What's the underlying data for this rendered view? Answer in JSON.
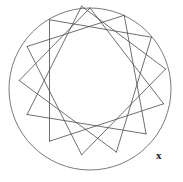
{
  "figure": {
    "name": "star-polygon-in-circle",
    "background_color": "#ffffff",
    "stroke_color": "#4a4a4a",
    "stroke_width": 0.8,
    "circle": {
      "cx": 90,
      "cy": 89,
      "r": 81,
      "stroke_color": "#6b6b6b",
      "stroke_width": 0.9,
      "fill": "none"
    },
    "vertex_count": 14,
    "star_step": 4,
    "start_angle_deg": -90,
    "vertices": [
      {
        "index": 0,
        "x": 90.0,
        "y": 8.0
      },
      {
        "index": 1,
        "x": 124.2,
        "y": 15.3
      },
      {
        "index": 2,
        "x": 151.4,
        "y": 37.2
      },
      {
        "index": 3,
        "x": 165.6,
        "y": 69.0
      },
      {
        "index": 4,
        "x": 163.6,
        "y": 103.8
      },
      {
        "index": 5,
        "x": 146.1,
        "y": 133.9
      },
      {
        "index": 6,
        "x": 116.4,
        "y": 152.1
      },
      {
        "index": 7,
        "x": 81.6,
        "y": 154.8
      },
      {
        "index": 8,
        "x": 49.5,
        "y": 141.2
      },
      {
        "index": 9,
        "x": 27.1,
        "y": 114.5
      },
      {
        "index": 10,
        "x": 19.2,
        "y": 80.5
      },
      {
        "index": 11,
        "x": 27.1,
        "y": 46.5
      },
      {
        "index": 12,
        "x": 49.5,
        "y": 19.8
      },
      {
        "index": 13,
        "x": 81.6,
        "y": 6.2
      }
    ],
    "edges": [
      {
        "from": 0,
        "to": 4
      },
      {
        "from": 4,
        "to": 8
      },
      {
        "from": 8,
        "to": 12
      },
      {
        "from": 12,
        "to": 2
      },
      {
        "from": 2,
        "to": 6
      },
      {
        "from": 6,
        "to": 10
      },
      {
        "from": 10,
        "to": 0
      },
      {
        "from": 1,
        "to": 5
      },
      {
        "from": 5,
        "to": 9
      },
      {
        "from": 9,
        "to": 13
      },
      {
        "from": 13,
        "to": 3
      },
      {
        "from": 3,
        "to": 7
      },
      {
        "from": 7,
        "to": 11
      },
      {
        "from": 11,
        "to": 1
      }
    ]
  },
  "annotations": {
    "point_label": {
      "text": "x",
      "x": 156,
      "y": 150,
      "color": "#1a1a1a"
    }
  }
}
